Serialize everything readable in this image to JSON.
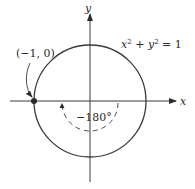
{
  "diagram": {
    "axes": {
      "x_label": "x",
      "y_label": "y"
    },
    "circle": {
      "equation": {
        "x": "x",
        "sup1": "2",
        "plus": " + ",
        "y": "y",
        "sup2": "2",
        "eq": " = 1"
      }
    },
    "point": {
      "label": "(−1, 0)"
    },
    "angle": {
      "label": "−180°"
    },
    "colors": {
      "stroke": "#3a3a3a",
      "text": "#2a2a2a"
    }
  }
}
